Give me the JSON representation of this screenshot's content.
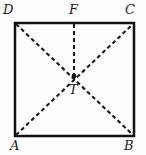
{
  "figure": {
    "type": "geometry-diagram",
    "background_color": "#fdfdfd",
    "stroke_color": "#1a1a1a",
    "square": {
      "name": "square-ABCD",
      "border_color": "#111111",
      "border_width_px": 2.5,
      "vertices": {
        "A": {
          "x": 15,
          "y": 136
        },
        "B": {
          "x": 134,
          "y": 136
        },
        "C": {
          "x": 134,
          "y": 23
        },
        "D": {
          "x": 15,
          "y": 23
        }
      }
    },
    "points": [
      {
        "name": "point-T",
        "label": "T",
        "x": 74,
        "y": 76,
        "marker": "filled-dot",
        "radius_px": 2.4
      }
    ],
    "dashed_lines": [
      {
        "name": "diagonal-D-B",
        "from": "D",
        "to": "B",
        "dash": "4 3"
      },
      {
        "name": "diagonal-A-C",
        "from": "A",
        "to": "C",
        "dash": "4 3"
      },
      {
        "name": "segment-F-T",
        "from": "F",
        "to": "T",
        "dash": "4 3"
      }
    ],
    "labels": {
      "D": "D",
      "F": "F",
      "C": "C",
      "A": "A",
      "B": "B",
      "T": "T"
    }
  }
}
